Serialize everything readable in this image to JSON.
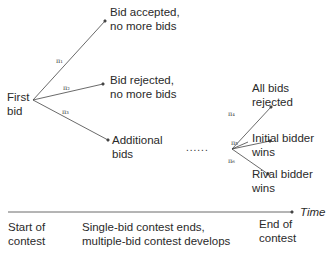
{
  "diagram": {
    "root": {
      "line1": "First",
      "line2": "bid"
    },
    "branches": [
      {
        "prob": "π₁",
        "line1": "Bid accepted,",
        "line2": "no more bids"
      },
      {
        "prob": "π₂",
        "line1": "Bid rejected,",
        "line2": "no more bids"
      },
      {
        "prob": "π₃",
        "line1": "Additional",
        "line2": "bids"
      }
    ],
    "ellipsis": "......",
    "sub_branches": [
      {
        "prob": "π₄",
        "line1": "All bids",
        "line2": "rejected"
      },
      {
        "prob": "π₅",
        "line1": "Initial bidder",
        "line2": "wins"
      },
      {
        "prob": "π₆",
        "line1": "Rival bidder",
        "line2": "wins"
      }
    ],
    "timeline": {
      "axis_label": "Time",
      "labels": [
        {
          "line1": "Start of",
          "line2": "contest"
        },
        {
          "line1": "Single-bid contest ends,",
          "line2": "multiple-bid contest develops"
        },
        {
          "line1": "End of",
          "line2": "contest"
        }
      ]
    }
  }
}
